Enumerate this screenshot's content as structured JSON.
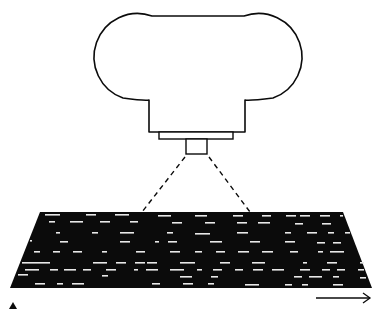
{
  "diagram": {
    "type": "line-scan camera over moving web",
    "colors": {
      "ink": "#0b0b0b",
      "paper": "#ffffff",
      "marks": "#e8e8e8"
    },
    "camera": {
      "body": {
        "x": 109,
        "y": 16,
        "w": 178,
        "h": 86
      },
      "neck": {
        "x": 149,
        "y": 100,
        "w": 96,
        "h": 32
      },
      "flange": {
        "x": 159,
        "y": 132,
        "w": 74,
        "h": 7
      },
      "lens": {
        "x": 186,
        "y": 139,
        "w": 21,
        "h": 15
      }
    },
    "field_of_view": {
      "left": [
        185,
        157,
        142,
        212
      ],
      "right": [
        209,
        157,
        250,
        212
      ]
    },
    "web": {
      "polygon": [
        [
          40,
          212
        ],
        [
          343,
          212
        ],
        [
          372,
          288
        ],
        [
          10,
          288
        ]
      ]
    },
    "direction_arrow": {
      "x1": 316,
      "y1": 298,
      "x2": 370,
      "y2": 298
    },
    "marker": {
      "x": 13,
      "y": 306
    },
    "marks": [
      [
        45,
        214,
        15
      ],
      [
        86,
        214,
        10
      ],
      [
        115,
        214,
        14
      ],
      [
        158,
        215,
        13
      ],
      [
        195,
        215,
        12
      ],
      [
        233,
        215,
        10
      ],
      [
        262,
        215,
        9
      ],
      [
        286,
        215,
        10
      ],
      [
        300,
        215,
        10
      ],
      [
        320,
        215,
        10
      ],
      [
        340,
        215,
        3
      ],
      [
        49,
        221,
        6
      ],
      [
        70,
        221,
        13
      ],
      [
        100,
        221,
        10
      ],
      [
        130,
        221,
        8
      ],
      [
        172,
        222,
        10
      ],
      [
        205,
        222,
        10
      ],
      [
        237,
        222,
        10
      ],
      [
        258,
        222,
        12
      ],
      [
        295,
        223,
        8
      ],
      [
        322,
        223,
        9
      ],
      [
        56,
        232,
        4
      ],
      [
        92,
        232,
        6
      ],
      [
        120,
        232,
        14
      ],
      [
        167,
        232,
        6
      ],
      [
        195,
        233,
        15
      ],
      [
        237,
        232,
        11
      ],
      [
        285,
        232,
        6
      ],
      [
        307,
        232,
        10
      ],
      [
        328,
        232,
        6
      ],
      [
        345,
        232,
        5
      ],
      [
        30,
        240,
        2
      ],
      [
        60,
        241,
        8
      ],
      [
        120,
        241,
        10
      ],
      [
        155,
        241,
        4
      ],
      [
        168,
        241,
        9
      ],
      [
        210,
        241,
        12
      ],
      [
        250,
        241,
        10
      ],
      [
        285,
        241,
        10
      ],
      [
        317,
        242,
        8
      ],
      [
        333,
        242,
        8
      ],
      [
        34,
        251,
        6
      ],
      [
        53,
        251,
        7
      ],
      [
        73,
        251,
        9
      ],
      [
        102,
        251,
        5
      ],
      [
        136,
        251,
        9
      ],
      [
        170,
        251,
        10
      ],
      [
        195,
        251,
        7
      ],
      [
        216,
        251,
        9
      ],
      [
        238,
        251,
        11
      ],
      [
        262,
        251,
        11
      ],
      [
        290,
        251,
        8
      ],
      [
        318,
        251,
        5
      ],
      [
        330,
        251,
        14
      ],
      [
        22,
        262,
        28
      ],
      [
        93,
        262,
        14
      ],
      [
        116,
        262,
        10
      ],
      [
        135,
        262,
        10
      ],
      [
        147,
        262,
        10
      ],
      [
        180,
        262,
        15
      ],
      [
        220,
        262,
        10
      ],
      [
        252,
        262,
        13
      ],
      [
        303,
        262,
        4
      ],
      [
        327,
        262,
        10
      ],
      [
        360,
        262,
        4
      ],
      [
        25,
        269,
        14
      ],
      [
        50,
        269,
        8
      ],
      [
        64,
        269,
        12
      ],
      [
        83,
        269,
        8
      ],
      [
        106,
        269,
        10
      ],
      [
        134,
        269,
        4
      ],
      [
        146,
        269,
        12
      ],
      [
        170,
        269,
        14
      ],
      [
        197,
        269,
        5
      ],
      [
        213,
        269,
        9
      ],
      [
        235,
        269,
        8
      ],
      [
        253,
        269,
        10
      ],
      [
        272,
        269,
        12
      ],
      [
        300,
        269,
        10
      ],
      [
        322,
        269,
        8
      ],
      [
        337,
        269,
        8
      ],
      [
        358,
        269,
        6
      ],
      [
        18,
        274,
        10
      ],
      [
        102,
        275,
        6
      ],
      [
        180,
        276,
        12
      ],
      [
        211,
        276,
        7
      ],
      [
        294,
        276,
        8
      ],
      [
        309,
        276,
        13
      ],
      [
        333,
        276,
        6
      ],
      [
        360,
        277,
        6
      ],
      [
        35,
        283,
        10
      ],
      [
        57,
        283,
        6
      ],
      [
        72,
        283,
        12
      ],
      [
        152,
        283,
        8
      ],
      [
        183,
        283,
        10
      ],
      [
        208,
        283,
        6
      ],
      [
        245,
        284,
        14
      ],
      [
        285,
        284,
        7
      ],
      [
        302,
        284,
        6
      ],
      [
        333,
        284,
        10
      ]
    ]
  }
}
